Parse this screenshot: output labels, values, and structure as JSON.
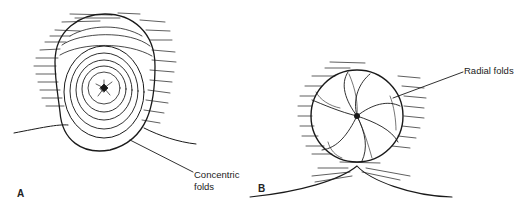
{
  "panels": [
    {
      "id": "A",
      "letter": "A",
      "callout": {
        "line1": "Concentric",
        "line2": "folds"
      }
    },
    {
      "id": "B",
      "letter": "B",
      "callout": {
        "line1": "Radial folds"
      }
    }
  ],
  "colors": {
    "ink": "#1a1a1a",
    "background": "#ffffff"
  }
}
